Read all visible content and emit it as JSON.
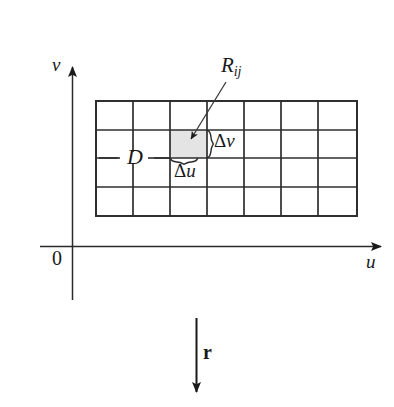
{
  "figure": {
    "kind": "math-diagram",
    "background_color": "#ffffff",
    "ink_color": "#1a1a1a",
    "shade_color": "#e2e2e2"
  },
  "axes": {
    "vertical_axis_label": "v",
    "horizontal_axis_label": "u",
    "origin_label": "0"
  },
  "labels": {
    "region": "D",
    "subrectangle_base": "R",
    "subrectangle_subscript": "ij",
    "delta_v_symbol": "Δ",
    "delta_v_variable": "v",
    "delta_u_symbol": "Δ",
    "delta_u_variable": "u",
    "vector": "r"
  },
  "grid": {
    "columns": 7,
    "rows": 4,
    "left": 96,
    "top": 101,
    "right": 357,
    "bottom": 216,
    "highlighted_cell": {
      "column_index": 2,
      "row_index": 1
    },
    "x_lines": [
      96,
      133,
      170,
      207,
      244,
      281,
      318,
      357
    ],
    "y_lines": [
      101,
      130,
      158,
      187,
      216
    ]
  }
}
